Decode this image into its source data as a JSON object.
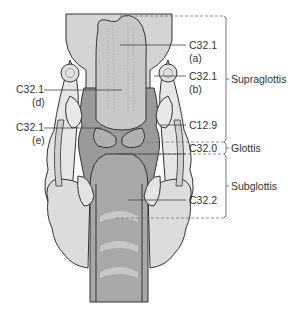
{
  "diagram": {
    "type": "anatomical-diagram",
    "labels": {
      "a": {
        "code": "C32.1",
        "sub": "(a)"
      },
      "b": {
        "code": "C32.1",
        "sub": "(b)"
      },
      "d": {
        "code": "C32.1",
        "sub": "(d)"
      },
      "e": {
        "code": "C32.1",
        "sub": "(e)"
      },
      "c129": {
        "code": "C12.9"
      },
      "c320": {
        "code": "C32.0"
      },
      "c322": {
        "code": "C32.2"
      }
    },
    "regions": {
      "supraglottis": "Supraglottis",
      "glottis": "Glottis",
      "subglottis": "Subglottis"
    },
    "colors": {
      "outline": "#333333",
      "light_fill": "#e3e3e3",
      "mid_fill": "#bdbdbd",
      "dark_fill": "#8e8e8e",
      "leader": "#444444",
      "dashed": "#777777"
    }
  }
}
